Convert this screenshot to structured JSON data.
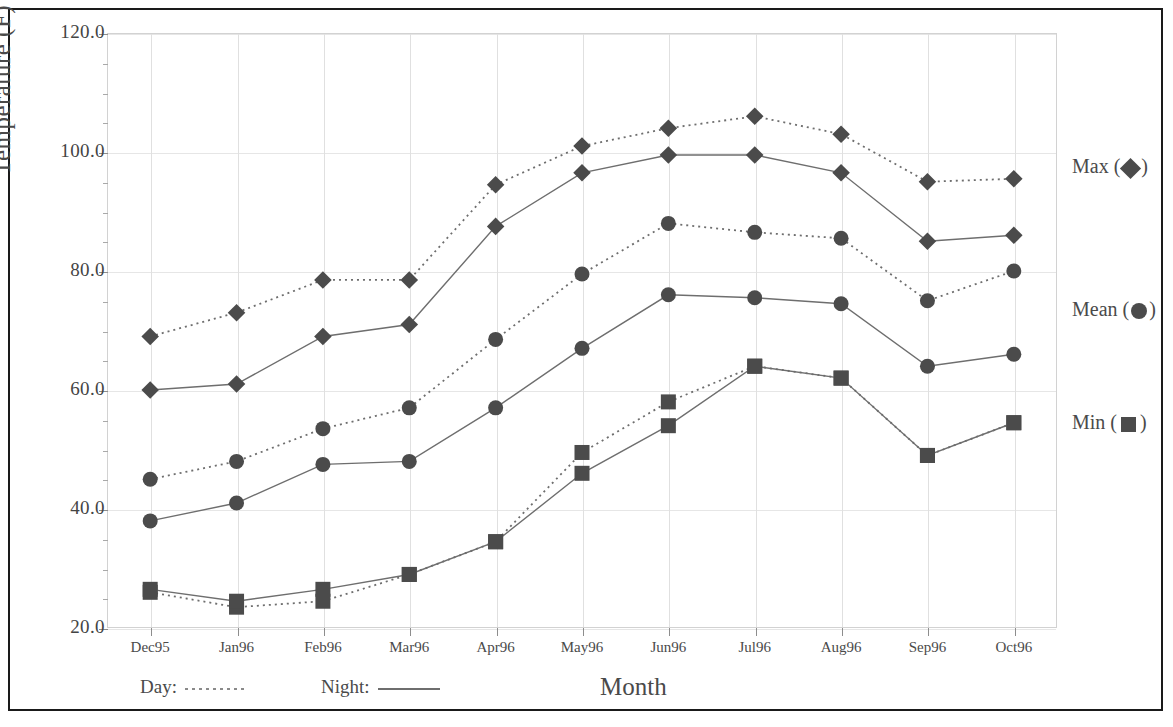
{
  "chart_data": {
    "type": "line",
    "title": "",
    "xlabel": "Month",
    "ylabel": "Temperature (F)",
    "categories": [
      "Dec95",
      "Jan96",
      "Feb96",
      "Mar96",
      "Apr96",
      "May96",
      "Jun96",
      "Jul96",
      "Aug96",
      "Sep96",
      "Oct96"
    ],
    "ylim": [
      20.0,
      120.0
    ],
    "ytick_labels": [
      "120.0",
      "100.0",
      "80.0",
      "60.0",
      "40.0",
      "20.0"
    ],
    "ytick_values": [
      120.0,
      100.0,
      80.0,
      60.0,
      40.0,
      20.0
    ],
    "ytick_minor_step": 5.0,
    "grid": true,
    "legend_position": "right and bottom",
    "series": [
      {
        "name": "Max Day",
        "stat": "Max",
        "period": "Day",
        "style": "dotted",
        "marker": "diamond",
        "values": [
          69.0,
          73.0,
          78.5,
          78.5,
          94.5,
          101.0,
          104.0,
          106.0,
          103.0,
          95.0,
          95.5
        ]
      },
      {
        "name": "Max Night",
        "stat": "Max",
        "period": "Night",
        "style": "solid",
        "marker": "diamond",
        "values": [
          60.0,
          61.0,
          69.0,
          71.0,
          87.5,
          96.5,
          99.5,
          99.5,
          96.5,
          85.0,
          86.0
        ]
      },
      {
        "name": "Mean Day",
        "stat": "Mean",
        "period": "Day",
        "style": "dotted",
        "marker": "circle",
        "values": [
          45.0,
          48.0,
          53.5,
          57.0,
          68.5,
          79.5,
          88.0,
          86.5,
          85.5,
          75.0,
          80.0
        ]
      },
      {
        "name": "Mean Night",
        "stat": "Mean",
        "period": "Night",
        "style": "solid",
        "marker": "circle",
        "values": [
          38.0,
          41.0,
          47.5,
          48.0,
          57.0,
          67.0,
          76.0,
          75.5,
          74.5,
          64.0,
          66.0
        ]
      },
      {
        "name": "Min Day",
        "stat": "Min",
        "period": "Day",
        "style": "dotted",
        "marker": "square",
        "values": [
          26.0,
          23.5,
          24.5,
          29.0,
          34.5,
          49.5,
          58.0,
          64.0,
          62.0,
          49.0,
          54.5
        ]
      },
      {
        "name": "Min Night",
        "stat": "Min",
        "period": "Night",
        "style": "solid",
        "marker": "square",
        "values": [
          26.5,
          24.5,
          26.5,
          29.0,
          34.5,
          46.0,
          54.0,
          64.0,
          62.0,
          49.0,
          54.5
        ]
      }
    ],
    "right_legend": [
      {
        "label_before": "Max (",
        "label_after": ")",
        "marker": "diamond",
        "value": 97.0
      },
      {
        "label_before": "Mean (",
        "label_after": ")",
        "marker": "circle",
        "value": 73.0
      },
      {
        "label_before": "Min (",
        "label_after": ")",
        "marker": "square",
        "value": 54.0
      }
    ],
    "bottom_legend": [
      {
        "label": "Day:",
        "style": "dotted"
      },
      {
        "label": "Night:",
        "style": "solid"
      }
    ],
    "colors": {
      "ink": "#4b4b4b",
      "line": "#6e6e6e",
      "grid": "#e0e0e0",
      "frame": "#1a1a1a",
      "text": "#4a4a4a"
    }
  }
}
